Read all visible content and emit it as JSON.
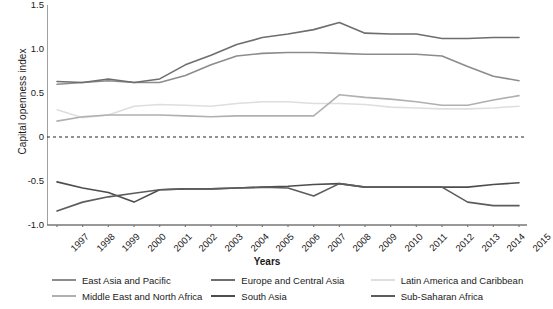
{
  "chart_data": {
    "type": "line",
    "title": "",
    "xlabel": "Years",
    "ylabel": "Capital openness index",
    "xlim": [
      1997,
      2015
    ],
    "ylim": [
      -1.0,
      1.5
    ],
    "yticks": [
      "1.5",
      "1.0",
      "0.5",
      "0",
      "-0.5",
      "-1.0"
    ],
    "ytick_values": [
      1.5,
      1.0,
      0.5,
      0,
      -0.5,
      -1.0
    ],
    "grid": false,
    "zero_line": true,
    "legend_position": "bottom",
    "legend_columns": 3,
    "categories": [
      "1997",
      "1998",
      "1999",
      "2000",
      "2001",
      "2002",
      "2003",
      "2004",
      "2005",
      "2006",
      "2007",
      "2008",
      "2009",
      "2010",
      "2011",
      "2012",
      "2013",
      "2014",
      "2015"
    ],
    "series": [
      {
        "name": "East Asia and Pacific",
        "color": "#8c8c8c",
        "values": [
          0.6,
          0.62,
          0.64,
          0.62,
          0.62,
          0.7,
          0.82,
          0.92,
          0.95,
          0.96,
          0.96,
          0.95,
          0.94,
          0.94,
          0.94,
          0.92,
          0.8,
          0.69,
          0.64
        ]
      },
      {
        "name": "Europe and Central Asia",
        "color": "#6e6e6e",
        "values": [
          0.63,
          0.62,
          0.66,
          0.62,
          0.66,
          0.82,
          0.93,
          1.05,
          1.13,
          1.17,
          1.22,
          1.3,
          1.18,
          1.17,
          1.17,
          1.12,
          1.12,
          1.13,
          1.13
        ]
      },
      {
        "name": "Latin America and Caribbean",
        "color": "#dedede",
        "values": [
          0.31,
          0.22,
          0.25,
          0.35,
          0.37,
          0.36,
          0.35,
          0.38,
          0.4,
          0.4,
          0.38,
          0.38,
          0.37,
          0.34,
          0.33,
          0.32,
          0.32,
          0.33,
          0.35
        ]
      },
      {
        "name": "Middle East and North Africa",
        "color": "#b0b0b0",
        "values": [
          0.18,
          0.23,
          0.25,
          0.25,
          0.25,
          0.24,
          0.23,
          0.24,
          0.24,
          0.24,
          0.24,
          0.48,
          0.45,
          0.43,
          0.4,
          0.36,
          0.36,
          0.42,
          0.47
        ]
      },
      {
        "name": "South Asia",
        "color": "#4d4d4d",
        "values": [
          -0.51,
          -0.58,
          -0.63,
          -0.74,
          -0.6,
          -0.59,
          -0.59,
          -0.58,
          -0.57,
          -0.56,
          -0.54,
          -0.53,
          -0.57,
          -0.57,
          -0.57,
          -0.57,
          -0.57,
          -0.54,
          -0.52
        ]
      },
      {
        "name": "Sub-Saharan Africa",
        "color": "#5c5c5c",
        "values": [
          -0.84,
          -0.74,
          -0.68,
          -0.64,
          -0.6,
          -0.59,
          -0.59,
          -0.58,
          -0.57,
          -0.58,
          -0.67,
          -0.53,
          -0.57,
          -0.57,
          -0.57,
          -0.57,
          -0.74,
          -0.78,
          -0.78
        ]
      }
    ]
  },
  "legend": {
    "items": [
      {
        "label": "East Asia and Pacific",
        "color": "#8c8c8c"
      },
      {
        "label": "Europe and Central Asia",
        "color": "#6e6e6e"
      },
      {
        "label": "Latin America and Caribbean",
        "color": "#dedede"
      },
      {
        "label": "Middle East and North Africa",
        "color": "#b0b0b0"
      },
      {
        "label": "South Asia",
        "color": "#4d4d4d"
      },
      {
        "label": "Sub-Saharan Africa",
        "color": "#5c5c5c"
      }
    ]
  },
  "axes": {
    "y_title": "Capital openness index",
    "x_title": "Years"
  }
}
